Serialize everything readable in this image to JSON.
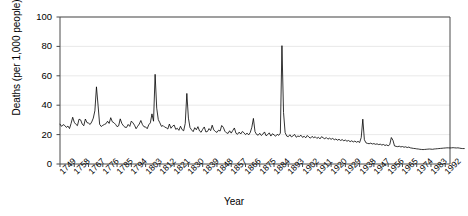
{
  "chart_data": {
    "type": "line",
    "title": "",
    "xlabel": "Year",
    "ylabel": "Deaths (per 1,000 people)",
    "ylim": [
      0,
      100
    ],
    "xlim": [
      1749,
      1995
    ],
    "yticks": [
      0,
      20,
      40,
      60,
      80,
      100
    ],
    "grid": true,
    "grid_axis": "y",
    "legend": "none",
    "line_color": "#000000",
    "line_width": 0.8,
    "xticks": [
      1749,
      1758,
      1767,
      1776,
      1785,
      1794,
      1803,
      1812,
      1821,
      1830,
      1839,
      1848,
      1857,
      1866,
      1875,
      1884,
      1893,
      1902,
      1911,
      1920,
      1929,
      1938,
      1947,
      1956,
      1965,
      1974,
      1983,
      1992
    ],
    "xtick_step": 9,
    "series": [
      {
        "name": "Death rate",
        "x_start": 1749,
        "x_step": 1,
        "values": [
          27.1,
          25.6,
          26.8,
          26.2,
          24.9,
          25.8,
          24.1,
          27.6,
          31.8,
          28.4,
          27.0,
          26.1,
          30.5,
          30.0,
          27.2,
          26.0,
          30.6,
          28.2,
          27.8,
          26.9,
          28.6,
          31.2,
          36.2,
          52.5,
          40.0,
          27.0,
          25.5,
          26.3,
          26.9,
          27.4,
          29.1,
          27.6,
          31.5,
          28.7,
          28.1,
          27.0,
          25.4,
          26.0,
          30.7,
          27.6,
          26.0,
          25.0,
          24.9,
          26.9,
          25.6,
          29.2,
          28.0,
          26.4,
          24.0,
          25.7,
          27.2,
          29.6,
          26.8,
          25.3,
          25.2,
          24.0,
          26.7,
          28.0,
          34.1,
          29.1,
          61.0,
          38.0,
          30.2,
          28.0,
          25.6,
          26.2,
          25.1,
          24.7,
          23.8,
          27.2,
          24.3,
          25.7,
          26.5,
          23.6,
          24.3,
          22.9,
          25.7,
          23.4,
          22.6,
          27.6,
          48.0,
          31.2,
          24.8,
          23.2,
          22.0,
          24.7,
          23.3,
          25.4,
          22.5,
          21.6,
          23.6,
          25.2,
          21.8,
          22.1,
          24.1,
          22.7,
          26.4,
          23.2,
          22.1,
          21.5,
          23.0,
          22.4,
          26.2,
          25.0,
          22.3,
          21.2,
          20.8,
          22.6,
          21.0,
          22.8,
          24.5,
          20.9,
          20.2,
          21.7,
          20.4,
          22.1,
          21.3,
          20.0,
          21.0,
          19.8,
          21.4,
          25.0,
          31.0,
          22.0,
          20.1,
          19.6,
          20.9,
          19.4,
          20.4,
          21.8,
          19.2,
          20.0,
          21.2,
          19.0,
          20.6,
          19.8,
          18.9,
          20.2,
          19.5,
          21.0,
          80.5,
          35.0,
          21.4,
          19.0,
          18.6,
          19.9,
          18.4,
          19.2,
          20.1,
          18.2,
          19.0,
          18.7,
          19.6,
          18.1,
          18.9,
          17.8,
          19.4,
          18.3,
          17.6,
          18.8,
          17.9,
          18.5,
          17.4,
          18.2,
          17.1,
          18.6,
          17.8,
          17.2,
          18.0,
          16.9,
          17.6,
          16.8,
          17.4,
          16.5,
          17.0,
          16.2,
          16.8,
          16.0,
          16.6,
          15.8,
          16.3,
          15.5,
          16.0,
          15.2,
          15.8,
          15.0,
          15.6,
          14.8,
          15.4,
          14.6,
          18.0,
          30.5,
          16.5,
          14.4,
          14.0,
          13.8,
          14.2,
          13.6,
          13.9,
          13.4,
          13.7,
          13.2,
          13.5,
          12.9,
          13.3,
          12.6,
          13.0,
          12.4,
          13.2,
          18.0,
          16.2,
          12.3,
          12.0,
          11.8,
          12.1,
          11.6,
          11.9,
          11.4,
          11.7,
          11.2,
          11.5,
          11.0,
          10.8,
          10.6,
          10.5,
          10.3,
          10.2,
          10.0,
          9.9,
          9.8,
          9.9,
          10.0,
          10.1,
          10.2,
          10.1,
          10.0,
          10.2,
          10.3,
          10.4,
          10.5,
          10.6,
          10.7,
          10.8,
          10.9,
          11.0,
          11.0,
          10.9,
          11.0,
          11.1,
          11.0,
          10.9,
          11.0,
          10.8,
          10.6,
          10.5,
          10.5
        ]
      }
    ]
  },
  "axis": {
    "ylabel": "Deaths (per 1,000 people)",
    "xlabel": "Year"
  }
}
